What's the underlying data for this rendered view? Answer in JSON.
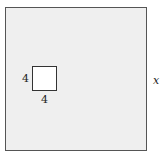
{
  "diagram": {
    "outer_square": {
      "side_label": "x",
      "fill": "#efefef"
    },
    "inner_square": {
      "left_label": "4",
      "bottom_label": "4",
      "fill": "#ffffff"
    }
  }
}
